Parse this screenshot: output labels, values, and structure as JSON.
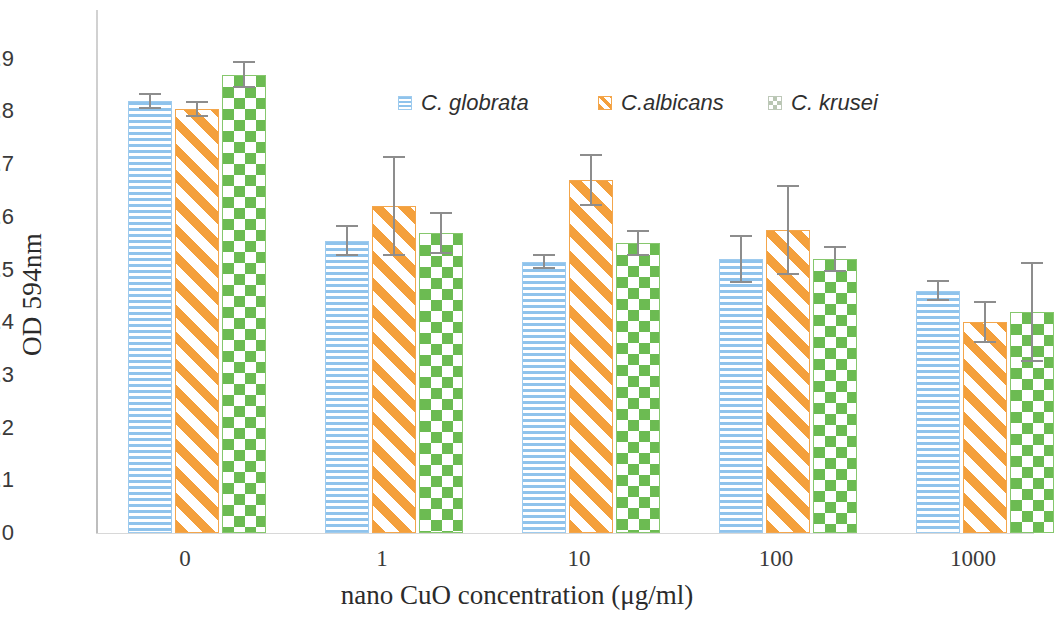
{
  "chart_data": {
    "type": "bar",
    "title": "",
    "xlabel": "nano CuO concentration (μg/ml)",
    "ylabel": "OD 594nm",
    "categories": [
      "0",
      "1",
      "10",
      "100",
      "1000"
    ],
    "ylim": [
      0,
      0.95
    ],
    "yticks": [
      "0",
      "0.1",
      "0.2",
      "0.3",
      "0.4",
      "0.5",
      "0.6",
      "0.7",
      "0.8",
      "0.9"
    ],
    "ytick_values": [
      0,
      0.1,
      0.2,
      0.3,
      0.4,
      0.5,
      0.6,
      0.7,
      0.8,
      0.9
    ],
    "grid": false,
    "legend_position": "upper-center",
    "series": [
      {
        "name": "C. globrata",
        "color": "#8fc3ec",
        "pattern": "horizontal-lines",
        "values": [
          0.82,
          0.555,
          0.515,
          0.52,
          0.46
        ],
        "errors": [
          0.015,
          0.03,
          0.015,
          0.045,
          0.02
        ]
      },
      {
        "name": "C.albicans",
        "color": "#f4a03c",
        "pattern": "diagonal-stripes",
        "values": [
          0.805,
          0.62,
          0.67,
          0.575,
          0.4
        ],
        "errors": [
          0.015,
          0.095,
          0.05,
          0.085,
          0.04
        ]
      },
      {
        "name": "C. krusei",
        "color": "#6cbb52",
        "pattern": "checkerboard",
        "values": [
          0.87,
          0.57,
          0.55,
          0.52,
          0.42
        ],
        "errors": [
          0.025,
          0.04,
          0.025,
          0.025,
          0.095
        ]
      }
    ]
  },
  "legend": {
    "items": [
      {
        "label": "C. globrata"
      },
      {
        "label": "C.albicans"
      },
      {
        "label": "C. krusei"
      }
    ]
  }
}
